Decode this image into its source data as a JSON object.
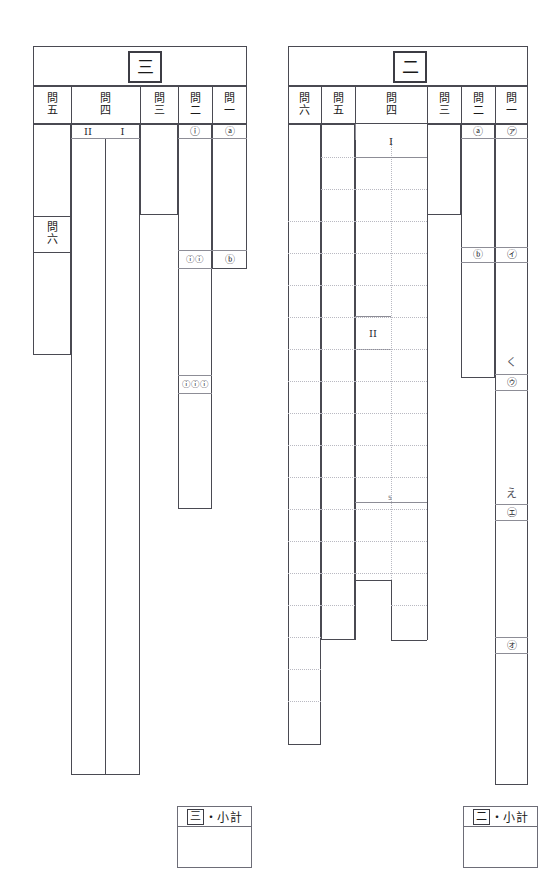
{
  "sheet": {
    "kind": "japanese-exam-answer-sheet",
    "width": 559,
    "height": 883,
    "ink_color": "#4a4a52",
    "grid_dot_color": "#b9b9c2",
    "paper_color": "#ffffff"
  },
  "panels": [
    {
      "id": "panel-san",
      "section_label": "三",
      "columns": [
        {
          "id": "q5",
          "header": "問五",
          "header_chars": [
            "問",
            "五"
          ]
        },
        {
          "id": "q4",
          "header": "問四",
          "header_chars": [
            "問",
            "四"
          ]
        },
        {
          "id": "q3",
          "header": "問三",
          "header_chars": [
            "問",
            "三"
          ]
        },
        {
          "id": "q2",
          "header": "問二",
          "header_chars": [
            "問",
            "二"
          ]
        },
        {
          "id": "q1",
          "header": "問一",
          "header_chars": [
            "問",
            "一"
          ]
        }
      ],
      "extra_header": {
        "label": "問六",
        "chars": [
          "問",
          "六"
        ]
      },
      "roman_labels": [
        {
          "id": "q4-II",
          "text": "II"
        },
        {
          "id": "q4-I",
          "text": "I"
        }
      ],
      "markers": [
        {
          "id": "q2-i",
          "text": "ⓘ"
        },
        {
          "id": "q1-a",
          "text": "ⓐ"
        },
        {
          "id": "q2-ii",
          "text": "ⓘⓘ"
        },
        {
          "id": "q1-b",
          "text": "ⓑ"
        },
        {
          "id": "q2-iii",
          "text": "ⓘⓘⓘ"
        }
      ],
      "subtotal": {
        "section": "三",
        "label": "・小計",
        "full": "三・小計"
      }
    },
    {
      "id": "panel-ni",
      "section_label": "二",
      "columns": [
        {
          "id": "q6",
          "header": "問六",
          "header_chars": [
            "問",
            "六"
          ]
        },
        {
          "id": "q5",
          "header": "問五",
          "header_chars": [
            "問",
            "五"
          ]
        },
        {
          "id": "q4",
          "header": "問四",
          "header_chars": [
            "問",
            "四"
          ]
        },
        {
          "id": "q3",
          "header": "問三",
          "header_chars": [
            "問",
            "三"
          ]
        },
        {
          "id": "q2",
          "header": "問二",
          "header_chars": [
            "問",
            "二"
          ]
        },
        {
          "id": "q1",
          "header": "問一",
          "header_chars": [
            "問",
            "一"
          ]
        }
      ],
      "roman_labels": [
        {
          "id": "q4-I",
          "text": "I"
        },
        {
          "id": "q4-II",
          "text": "II"
        }
      ],
      "markers": [
        {
          "id": "q2-a",
          "text": "ⓐ"
        },
        {
          "id": "q1-a",
          "text": "㋐"
        },
        {
          "id": "q2-b",
          "text": "ⓑ"
        },
        {
          "id": "q1-i",
          "text": "㋑"
        },
        {
          "id": "q1-u",
          "text": "㋒"
        },
        {
          "id": "q1-e",
          "text": "㋓"
        },
        {
          "id": "q1-o",
          "text": "㋔"
        }
      ],
      "handwriting": [
        {
          "id": "hand-ku",
          "text": "く"
        },
        {
          "id": "hand-e",
          "text": "え"
        }
      ],
      "tick_counter": {
        "id": "row-count-5",
        "text": "5"
      },
      "subtotal": {
        "section": "二",
        "label": "・小計",
        "full": "二・小計"
      }
    }
  ]
}
